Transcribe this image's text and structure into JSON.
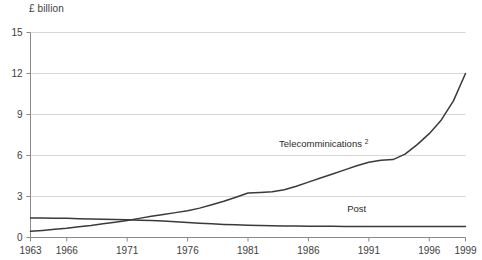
{
  "unit_label": "£ billion",
  "colors": {
    "line": "#3a3a3a",
    "grid": "#d8d8d8",
    "axis": "#8a8a8a",
    "text": "#3d3d3d",
    "background": "#ffffff"
  },
  "labels": {
    "telecom_label": "Telecomminications",
    "telecom_footnote": "2",
    "post_label": "Post"
  },
  "chart_data": {
    "type": "line",
    "title": "",
    "xlabel": "",
    "ylabel": "£ billion",
    "xlim": [
      1963,
      1999
    ],
    "ylim": [
      0,
      15
    ],
    "yticks": [
      0,
      3,
      6,
      9,
      12,
      15
    ],
    "xticks": [
      1963,
      1966,
      1971,
      1976,
      1981,
      1986,
      1991,
      1996,
      1999
    ],
    "grid": true,
    "legend": "inline-annotations",
    "x": [
      1963,
      1964,
      1965,
      1966,
      1967,
      1968,
      1969,
      1970,
      1971,
      1972,
      1973,
      1974,
      1975,
      1976,
      1977,
      1978,
      1979,
      1980,
      1981,
      1982,
      1983,
      1984,
      1985,
      1986,
      1987,
      1988,
      1989,
      1990,
      1991,
      1992,
      1993,
      1994,
      1995,
      1996,
      1997,
      1998,
      1999
    ],
    "series": [
      {
        "name": "Telecomminications",
        "values": [
          0.45,
          0.52,
          0.6,
          0.68,
          0.78,
          0.88,
          1.0,
          1.12,
          1.25,
          1.4,
          1.55,
          1.68,
          1.82,
          1.95,
          2.15,
          2.4,
          2.65,
          2.95,
          3.25,
          3.3,
          3.35,
          3.5,
          3.75,
          4.05,
          4.35,
          4.65,
          4.95,
          5.25,
          5.5,
          5.65,
          5.7,
          6.1,
          6.8,
          7.6,
          8.6,
          10.0,
          12.0
        ]
      },
      {
        "name": "Post",
        "values": [
          1.42,
          1.42,
          1.41,
          1.4,
          1.38,
          1.36,
          1.34,
          1.32,
          1.29,
          1.26,
          1.24,
          1.2,
          1.15,
          1.1,
          1.05,
          1.0,
          0.96,
          0.93,
          0.9,
          0.88,
          0.86,
          0.85,
          0.84,
          0.83,
          0.82,
          0.82,
          0.81,
          0.81,
          0.8,
          0.8,
          0.8,
          0.8,
          0.8,
          0.8,
          0.8,
          0.8,
          0.8
        ]
      }
    ],
    "annotations": [
      {
        "text": "Telecomminications",
        "superscript": "2",
        "x": 1987,
        "y": 6.6
      },
      {
        "text": "Post",
        "x": 1990,
        "y": 1.9
      }
    ]
  }
}
